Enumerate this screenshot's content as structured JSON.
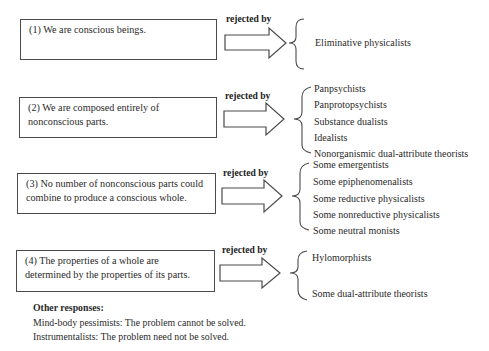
{
  "claims": [
    {
      "label": "(1) We are conscious beings.",
      "rejected_by_label": "rejected by",
      "responders": [
        "Eliminative physicalists"
      ]
    },
    {
      "label": "(2) We are composed entirely of nonconscious parts.",
      "rejected_by_label": "rejected by",
      "responders": [
        "Panpsychists",
        "Panprotopsychists",
        "Substance dualists",
        "Idealists",
        "Nonorganismic dual-attribute theorists"
      ]
    },
    {
      "label": "(3) No number of nonconscious parts could combine to produce a conscious whole.",
      "rejected_by_label": "rejected by",
      "responders": [
        "Some emergentists",
        "Some epiphenomenalists",
        "Some reductive physicalists",
        "Some nonreductive physicalists",
        "Some neutral monists"
      ]
    },
    {
      "label": "(4) The properties of a whole are determined by the properties of its parts.",
      "rejected_by_label": "rejected by",
      "responders": [
        "Hylomorphists",
        "Some dual-attribute theorists"
      ]
    }
  ],
  "other_responses": {
    "heading": "Other responses:",
    "lines": [
      "Mind-body pessimists: The problem cannot be solved.",
      "Instrumentalists: The problem need not be solved."
    ]
  }
}
